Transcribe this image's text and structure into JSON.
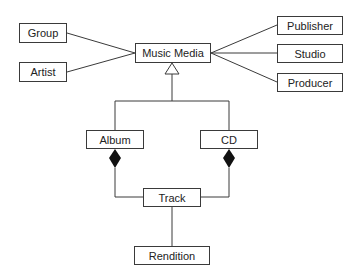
{
  "diagram": {
    "type": "UML class diagram",
    "classes": {
      "group": "Group",
      "artist": "Artist",
      "music_media": "Music Media",
      "publisher": "Publisher",
      "studio": "Studio",
      "producer": "Producer",
      "album": "Album",
      "cd": "CD",
      "track": "Track",
      "rendition": "Rendition"
    },
    "relationships": [
      {
        "from": "Group",
        "to": "Music Media",
        "kind": "association"
      },
      {
        "from": "Artist",
        "to": "Music Media",
        "kind": "association"
      },
      {
        "from": "Publisher",
        "to": "Music Media",
        "kind": "association"
      },
      {
        "from": "Studio",
        "to": "Music Media",
        "kind": "association"
      },
      {
        "from": "Producer",
        "to": "Music Media",
        "kind": "association"
      },
      {
        "from": "Album",
        "to": "Music Media",
        "kind": "generalization"
      },
      {
        "from": "CD",
        "to": "Music Media",
        "kind": "generalization"
      },
      {
        "from": "Album",
        "to": "Track",
        "kind": "composition"
      },
      {
        "from": "CD",
        "to": "Track",
        "kind": "composition"
      },
      {
        "from": "Track",
        "to": "Rendition",
        "kind": "association"
      }
    ],
    "colors": {
      "line": "#3a3a3a",
      "fill": "#ffffff",
      "diamond": "#111111"
    }
  }
}
